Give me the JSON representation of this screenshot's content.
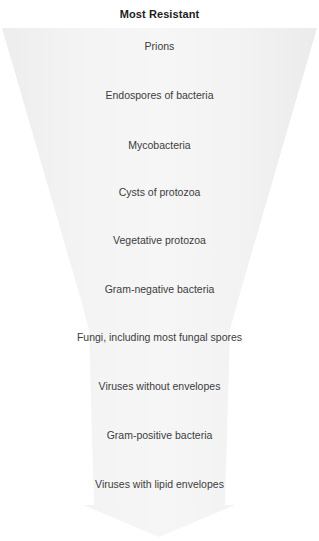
{
  "figure": {
    "title": "Most Resistant",
    "background_color": "#ffffff",
    "funnel_fill_color": "#f1f1f1",
    "text_color": "#3c3c3c",
    "title_color": "#1d1d1d"
  },
  "tiers": [
    {
      "label": "Prions",
      "center_y": 46
    },
    {
      "label": "Endospores of bacteria",
      "center_y": 95
    },
    {
      "label": "Mycobacteria",
      "center_y": 145
    },
    {
      "label": "Cysts of protozoa",
      "center_y": 192
    },
    {
      "label": "Vegetative protozoa",
      "center_y": 240
    },
    {
      "label": "Gram-negative bacteria",
      "center_y": 289
    },
    {
      "label": "Fungi, including most fungal spores",
      "center_y": 337
    },
    {
      "label": "Viruses without envelopes",
      "center_y": 386
    },
    {
      "label": "Gram-positive bacteria",
      "center_y": 435
    },
    {
      "label": "Viruses with lipid envelopes",
      "center_y": 484
    }
  ]
}
